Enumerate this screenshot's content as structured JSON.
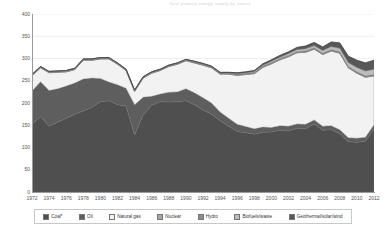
{
  "chart_data": {
    "type": "area",
    "title": "Total primary energy supply by source",
    "xlabel": "",
    "ylabel": "",
    "ylim": [
      0,
      400
    ],
    "yticks": [
      0,
      50,
      100,
      150,
      200,
      250,
      300,
      350,
      400
    ],
    "xticks": [
      1972,
      1974,
      1976,
      1978,
      1980,
      1982,
      1984,
      1986,
      1988,
      1990,
      1992,
      1994,
      1996,
      1998,
      2000,
      2002,
      2004,
      2006,
      2008,
      2010,
      2012
    ],
    "grid": true,
    "stacked": true,
    "legend_position": "bottom",
    "x": [
      1972,
      1973,
      1974,
      1975,
      1976,
      1977,
      1978,
      1979,
      1980,
      1981,
      1982,
      1983,
      1984,
      1985,
      1986,
      1987,
      1988,
      1989,
      1990,
      1991,
      1992,
      1993,
      1994,
      1995,
      1996,
      1997,
      1998,
      1999,
      2000,
      2001,
      2002,
      2003,
      2004,
      2005,
      2006,
      2007,
      2008,
      2009,
      2010,
      2011,
      2012
    ],
    "series": [
      {
        "name": "Coal*",
        "color": "#4f4f4f",
        "values": [
          152,
          170,
          148,
          157,
          166,
          175,
          182,
          190,
          203,
          205,
          196,
          193,
          128,
          173,
          195,
          203,
          202,
          203,
          205,
          196,
          184,
          175,
          160,
          148,
          136,
          133,
          130,
          134,
          135,
          139,
          137,
          143,
          142,
          153,
          139,
          140,
          131,
          113,
          112,
          114,
          142
        ]
      },
      {
        "name": "Oil",
        "color": "#5e5e5e",
        "values": [
          75,
          78,
          80,
          75,
          72,
          70,
          72,
          66,
          52,
          42,
          45,
          40,
          68,
          40,
          20,
          17,
          22,
          22,
          27,
          27,
          28,
          25,
          20,
          18,
          16,
          14,
          12,
          12,
          10,
          10,
          11,
          10,
          10,
          9,
          9,
          9,
          9,
          9,
          9,
          9,
          9
        ]
      },
      {
        "name": "Natural gas",
        "color": "#f2f2f2",
        "values": [
          34,
          31,
          40,
          37,
          32,
          30,
          42,
          40,
          44,
          52,
          46,
          40,
          30,
          43,
          52,
          53,
          58,
          62,
          63,
          67,
          73,
          79,
          85,
          99,
          110,
          117,
          124,
          134,
          143,
          148,
          156,
          160,
          162,
          159,
          161,
          168,
          172,
          157,
          146,
          135,
          110
        ]
      },
      {
        "name": "Nuclear",
        "color": "#a5a5a5",
        "values": [
          0,
          0,
          0,
          0,
          0,
          0,
          0,
          0,
          0,
          0,
          0,
          0,
          0,
          0,
          0,
          0,
          0,
          0,
          0,
          0,
          0,
          0,
          0,
          0,
          0,
          0,
          0,
          0,
          0,
          0,
          0,
          0,
          0,
          0,
          0,
          0,
          0,
          0,
          0,
          0,
          0
        ]
      },
      {
        "name": "Hydro",
        "color": "#8c8c8c",
        "values": [
          3,
          3,
          3,
          3,
          3,
          3,
          3,
          3,
          3,
          3,
          3,
          3,
          3,
          3,
          3,
          3,
          3,
          3,
          3,
          3,
          3,
          3,
          3,
          3,
          3,
          3,
          3,
          3,
          3,
          3,
          3,
          3,
          3,
          3,
          3,
          3,
          3,
          3,
          3,
          3,
          3
        ]
      },
      {
        "name": "Biofuels/waste",
        "color": "#bdbdbd",
        "values": [
          0,
          0,
          0,
          0,
          0,
          0,
          0,
          0,
          0,
          0,
          0,
          0,
          0,
          0,
          0,
          0,
          0,
          0,
          0,
          0,
          0,
          0,
          0,
          0,
          1,
          1,
          2,
          2,
          3,
          3,
          4,
          4,
          5,
          5,
          6,
          7,
          8,
          9,
          10,
          11,
          12
        ]
      },
      {
        "name": "Geothermal/solar/wind",
        "color": "#585858",
        "values": [
          0,
          0,
          0,
          0,
          0,
          0,
          0,
          0,
          0,
          0,
          0,
          0,
          0,
          0,
          0,
          0,
          0,
          0,
          0,
          1,
          1,
          1,
          1,
          1,
          2,
          2,
          2,
          3,
          3,
          4,
          4,
          5,
          6,
          7,
          8,
          10,
          12,
          14,
          16,
          18,
          20
        ]
      }
    ],
    "totals": [
      264,
      282,
      271,
      272,
      273,
      278,
      299,
      299,
      302,
      302,
      290,
      276,
      229,
      259,
      270,
      276,
      285,
      290,
      298,
      294,
      289,
      283,
      269,
      269,
      268,
      267,
      271,
      285,
      294,
      304,
      311,
      325,
      328,
      336,
      326,
      337,
      335,
      305,
      296,
      290,
      296
    ]
  },
  "legend": {
    "items": [
      {
        "label": "Coal*",
        "color": "#4f4f4f"
      },
      {
        "label": "Oil",
        "color": "#5e5e5e"
      },
      {
        "label": "Natural gas",
        "color": "#f2f2f2"
      },
      {
        "label": "Nuclear",
        "color": "#a5a5a5"
      },
      {
        "label": "Hydro",
        "color": "#8c8c8c"
      },
      {
        "label": "Biofuels/waste",
        "color": "#bdbdbd"
      },
      {
        "label": "Geothermal/solar/wind",
        "color": "#585858"
      }
    ]
  }
}
